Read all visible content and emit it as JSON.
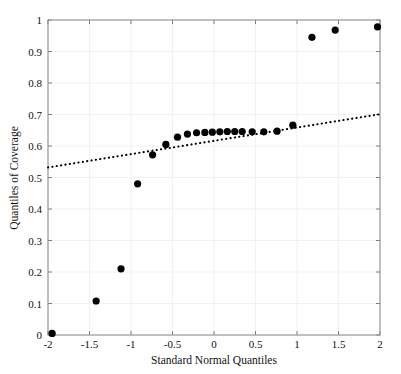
{
  "chart_data": {
    "type": "scatter",
    "title": "",
    "xlabel": "Standard Normal Quantiles",
    "ylabel": "Quantiles of Coverage",
    "xlim": [
      -2,
      2
    ],
    "ylim": [
      0,
      1
    ],
    "xticks": [
      -2,
      -1.5,
      -1,
      -0.5,
      0,
      0.5,
      1,
      1.5,
      2
    ],
    "xticklabels": [
      "-2",
      "-1.5",
      "-1",
      "-0.5",
      "0",
      "0.5",
      "1",
      "1.5",
      "2"
    ],
    "yticks": [
      0,
      0.1,
      0.2,
      0.3,
      0.4,
      0.5,
      0.6,
      0.7,
      0.8,
      0.9,
      1
    ],
    "yticklabels": [
      "0",
      "0.1",
      "0.2",
      "0.3",
      "0.4",
      "0.5",
      "0.6",
      "0.7",
      "0.8",
      "0.9",
      "1"
    ],
    "grid": true,
    "legend": "none",
    "series": [
      {
        "name": "Quantiles of Coverage",
        "marker": "filled-circle",
        "marker_color": "#000000",
        "marker_size": 6,
        "x": [
          -1.95,
          -1.42,
          -1.12,
          -0.92,
          -0.74,
          -0.58,
          -0.44,
          -0.32,
          -0.21,
          -0.11,
          -0.02,
          0.07,
          0.16,
          0.25,
          0.34,
          0.46,
          0.6,
          0.76,
          0.95,
          1.18,
          1.46,
          1.97
        ],
        "y": [
          0.005,
          0.108,
          0.21,
          0.48,
          0.572,
          0.605,
          0.628,
          0.638,
          0.642,
          0.643,
          0.644,
          0.645,
          0.646,
          0.646,
          0.646,
          0.645,
          0.645,
          0.647,
          0.666,
          0.945,
          0.968,
          0.978
        ]
      },
      {
        "name": "reference-line",
        "type": "line",
        "style": "dotted",
        "color": "#000000",
        "x": [
          -2,
          2
        ],
        "y": [
          0.532,
          0.701
        ]
      }
    ]
  }
}
